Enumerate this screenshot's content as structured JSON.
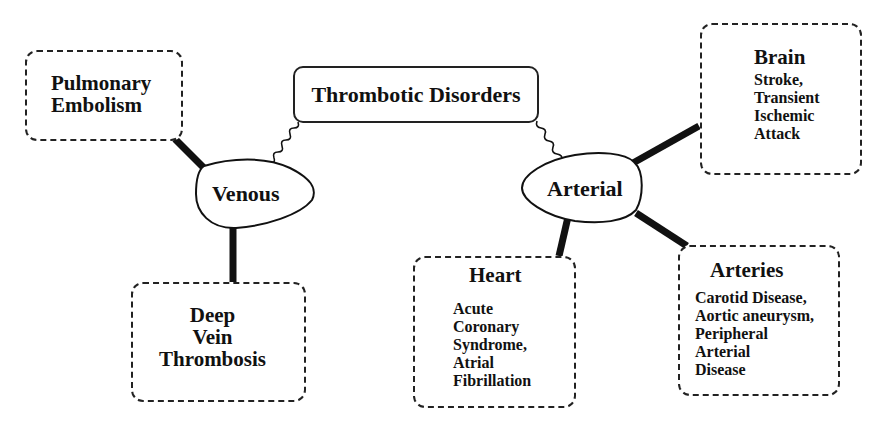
{
  "root": {
    "label": "Thrombotic Disorders"
  },
  "categories": {
    "venous": {
      "label": "Venous"
    },
    "arterial": {
      "label": "Arterial"
    }
  },
  "nodes": {
    "pulmonary": {
      "title_lines": [
        "Pulmonary",
        "Embolism"
      ]
    },
    "dvt": {
      "title_lines": [
        "Deep",
        "Vein",
        "Thrombosis"
      ]
    },
    "brain": {
      "title": "Brain",
      "details": [
        "Stroke,",
        "Transient",
        "Ischemic",
        "Attack"
      ]
    },
    "heart": {
      "title": "Heart",
      "details": [
        "Acute",
        "Coronary",
        "Syndrome,",
        "Atrial",
        "Fibrillation"
      ]
    },
    "arteries": {
      "title": "Arteries",
      "details": [
        "Carotid Disease,",
        "Aortic aneurysm,",
        "Peripheral",
        "Arterial",
        "Disease"
      ]
    }
  },
  "colors": {
    "stroke": "#111111",
    "background": "#ffffff"
  }
}
